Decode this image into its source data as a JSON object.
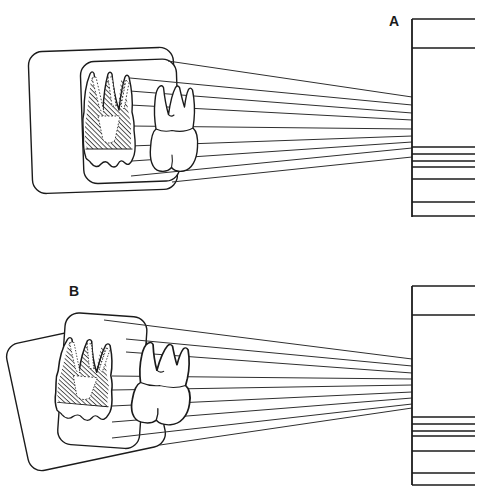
{
  "figure": {
    "background": "#ffffff",
    "ink": "#1b1b1b",
    "panels": [
      {
        "id": "a",
        "label": "A",
        "beam_lines": [
          [
            168,
            61,
            412,
            97
          ],
          [
            130,
            78,
            412,
            105
          ],
          [
            130,
            91,
            412,
            113
          ],
          [
            130,
            105,
            412,
            120
          ],
          [
            130,
            126,
            412,
            129
          ],
          [
            130,
            146,
            412,
            136
          ],
          [
            132,
            161,
            412,
            142
          ],
          [
            131,
            176,
            412,
            148
          ],
          [
            172,
            182,
            412,
            157
          ]
        ],
        "receptor": {
          "x": 412,
          "top": 19,
          "bottom": 217,
          "right": 475,
          "line_ys": [
            19,
            48,
            147,
            154,
            161,
            167,
            179,
            202,
            216
          ]
        }
      },
      {
        "id": "b",
        "label": "B",
        "beam_lines": [
          [
            104,
            320,
            412,
            359
          ],
          [
            126,
            339,
            412,
            366
          ],
          [
            126,
            352,
            412,
            373
          ],
          [
            112,
            376,
            412,
            379
          ],
          [
            112,
            390,
            412,
            385
          ],
          [
            112,
            406,
            412,
            392
          ],
          [
            112,
            422,
            412,
            398
          ],
          [
            112,
            438,
            412,
            404
          ],
          [
            160,
            445,
            412,
            408
          ]
        ],
        "receptor": {
          "x": 412,
          "top": 286,
          "bottom": 485,
          "right": 475,
          "line_ys": [
            286,
            315,
            417,
            424,
            431,
            436,
            451,
            473,
            485
          ]
        }
      }
    ]
  }
}
